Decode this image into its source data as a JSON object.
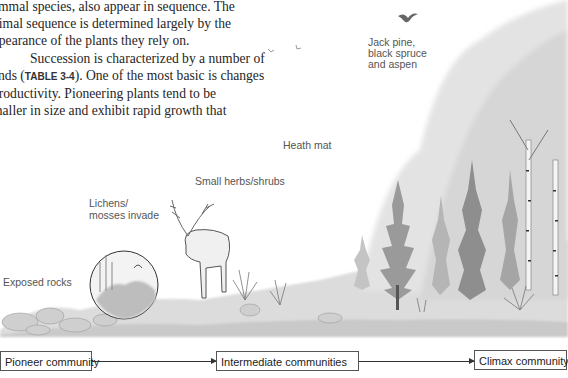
{
  "text": {
    "line1": "ammal species, also appear in sequence. The",
    "line2": "nimal sequence is determined largely by the",
    "line3": "ppearance of the plants they rely on.",
    "para2_start": "Succession is characterized by a number of",
    "para2_line2_pre": "ends (",
    "table_ref": "TABLE 3-4",
    "para2_line2_post": "). One of the most basic is changes",
    "para2_line3": " productivity. Pioneering plants tend to be",
    "para2_line4": "maller in size and exhibit rapid growth that"
  },
  "labels": {
    "exposed_rocks": "Exposed rocks",
    "lichens_line1": "Lichens/",
    "lichens_line2": "mosses invade",
    "small_herbs": "Small herbs/shrubs",
    "heath_mat": "Heath mat",
    "trees_line1": "Jack pine,",
    "trees_line2": "black spruce",
    "trees_line3": "and aspen"
  },
  "flow": {
    "stages": [
      "Pioneer community",
      "Intermediate communities",
      "Climax community"
    ]
  },
  "colors": {
    "text": "#262626",
    "label": "#555555",
    "sketch": "#8a8a8a",
    "box_border": "#555555"
  }
}
